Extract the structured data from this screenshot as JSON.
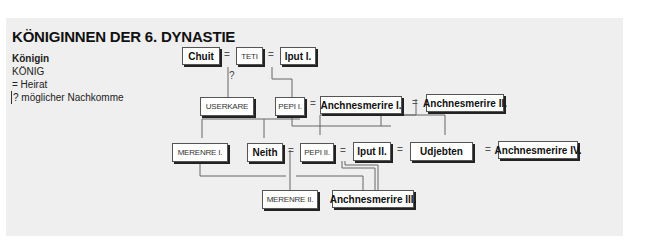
{
  "title": "KÖNIGINNEN DER 6. DYNASTIE",
  "legend": {
    "queen": "Königin",
    "king": "KÖNIG",
    "marriage": "= Heirat",
    "possible": "? möglicher Nachkomme"
  },
  "symbols": {
    "marriage": "=",
    "possible": "?"
  },
  "nodes": {
    "chuit": "Chuit",
    "teti": "TETI",
    "iput1": "Iput I.",
    "userkare": "USERKARE",
    "pepi1": "PEPI I.",
    "anch1": "Anchnesmerire I.",
    "anch2": "Anchnesmerire II.",
    "merenre1": "MERENRE I.",
    "neith": "Neith",
    "pepi2": "PEPI II.",
    "iput2": "Iput II.",
    "udjebten": "Udjebten",
    "anch4": "Anchnesmerire IV.",
    "merenre2": "MERENRE II.",
    "anch3": "Anchnesmerire III."
  },
  "colors": {
    "panel": "#efefef",
    "line": "#666666",
    "box_border": "#555555",
    "shadow": "#222222"
  }
}
